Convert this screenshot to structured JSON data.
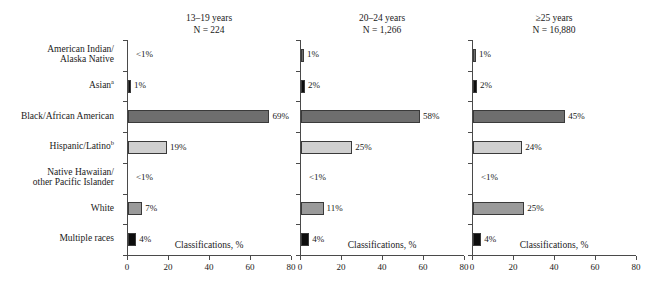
{
  "figure": {
    "axis_title": "Classifications, %",
    "categories": [
      {
        "lines": [
          "American Indian/",
          "Alaska Native"
        ],
        "sup": ""
      },
      {
        "lines": [
          "Asian"
        ],
        "sup": "a"
      },
      {
        "lines": [
          "Black/African American"
        ],
        "sup": ""
      },
      {
        "lines": [
          "Hispanic/Latino"
        ],
        "sup": "b"
      },
      {
        "lines": [
          "Native Hawaiian/",
          "other Pacific Islander"
        ],
        "sup": ""
      },
      {
        "lines": [
          "White"
        ],
        "sup": ""
      },
      {
        "lines": [
          "Multiple races"
        ],
        "sup": ""
      }
    ],
    "xticks": [
      0,
      20,
      40,
      60,
      80
    ],
    "panels": [
      {
        "title_line1": "13–19 years",
        "title_line2": "N = 224",
        "labels": [
          "<1%",
          "1%",
          "69%",
          "19%",
          "<1%",
          "7%",
          "4%"
        ],
        "values": [
          0.4,
          1,
          69,
          19,
          0.4,
          7,
          4
        ]
      },
      {
        "title_line1": "20–24 years",
        "title_line2": "N = 1,266",
        "labels": [
          "1%",
          "2%",
          "58%",
          "25%",
          "<1%",
          "11%",
          "4%"
        ],
        "values": [
          1,
          2,
          58,
          25,
          0.4,
          11,
          4
        ]
      },
      {
        "title_line1": "≥25 years",
        "title_line2": "N = 16,880",
        "labels": [
          "1%",
          "2%",
          "45%",
          "24%",
          "<1%",
          "25%",
          "4%"
        ],
        "values": [
          1,
          2,
          45,
          24,
          0.4,
          25,
          4
        ]
      }
    ]
  },
  "chart_data": {
    "type": "bar",
    "title": "",
    "orientation": "horizontal",
    "xlabel": "Classifications, %",
    "ylabel": "",
    "xlim": [
      0,
      80
    ],
    "xticks": [
      0,
      20,
      40,
      60,
      80
    ],
    "grid": false,
    "legend": "none",
    "categories": [
      "American Indian/Alaska Native",
      "Asian",
      "Black/African American",
      "Hispanic/Latino",
      "Native Hawaiian/other Pacific Islander",
      "White",
      "Multiple races"
    ],
    "panels": [
      {
        "name": "13–19 years",
        "n": "N = 224",
        "values": [
          0.4,
          1,
          69,
          19,
          0.4,
          7,
          4
        ],
        "data_labels": [
          "<1%",
          "1%",
          "69%",
          "19%",
          "<1%",
          "7%",
          "4%"
        ]
      },
      {
        "name": "20–24 years",
        "n": "N = 1,266",
        "values": [
          1,
          2,
          58,
          25,
          0.4,
          11,
          4
        ],
        "data_labels": [
          "1%",
          "2%",
          "58%",
          "25%",
          "<1%",
          "11%",
          "4%"
        ]
      },
      {
        "name": "≥25 years",
        "n": "N = 16,880",
        "values": [
          1,
          2,
          45,
          24,
          0.4,
          25,
          4
        ],
        "data_labels": [
          "1%",
          "2%",
          "45%",
          "24%",
          "<1%",
          "25%",
          "4%"
        ]
      }
    ],
    "bar_colors": {
      "american-indian-alaska-native": "#6e6e6e",
      "asian": "#0d0d0d",
      "black-african-american": "#6e6e6e",
      "hispanic-latino": "#cfcfcf",
      "native-hawaiian-pacific-islander": "#6e6e6e",
      "white": "#9a9a9a",
      "multiple-races": "#0d0d0d"
    },
    "footnote_markers": {
      "asian": "a",
      "hispanic-latino": "b"
    }
  }
}
